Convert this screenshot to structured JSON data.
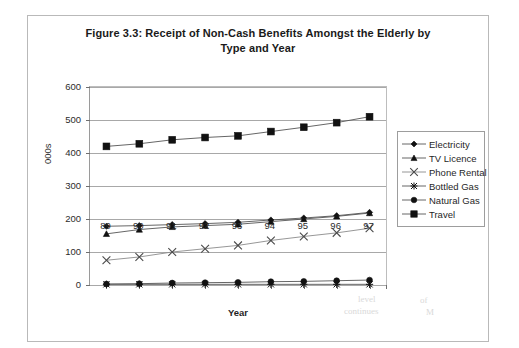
{
  "figure": {
    "title": "Figure 3.3: Receipt of Non-Cash Benefits Amongst the Elderly by Type and Year",
    "title_line1": "Figure 3.3: Receipt of Non-Cash Benefits Amongst the Elderly by",
    "title_line2": "Type and Year"
  },
  "artifacts": {
    "a1": "level",
    "a2": "continues",
    "a3": "of",
    "a4": "M"
  },
  "chart_data": {
    "type": "line",
    "title": "Figure 3.3: Receipt of Non-Cash Benefits Amongst the Elderly by Type and Year",
    "xlabel": "Year",
    "ylabel": "000s",
    "categories": [
      "89",
      "90",
      "91",
      "92",
      "93",
      "94",
      "95",
      "96",
      "97"
    ],
    "ylim": [
      0,
      600
    ],
    "yticks": [
      0,
      100,
      200,
      300,
      400,
      500,
      600
    ],
    "grid": true,
    "legend_position": "right",
    "series": [
      {
        "name": "Electricity",
        "marker": "diamond",
        "values": [
          178,
          180,
          183,
          186,
          190,
          197,
          203,
          210,
          220
        ]
      },
      {
        "name": "TV Licence",
        "marker": "triangle",
        "values": [
          155,
          168,
          176,
          180,
          184,
          192,
          200,
          208,
          218
        ]
      },
      {
        "name": "Phone Rental",
        "marker": "cross",
        "values": [
          75,
          85,
          100,
          110,
          120,
          135,
          147,
          158,
          172
        ]
      },
      {
        "name": "Bottled Gas",
        "marker": "star",
        "values": [
          2,
          2,
          2,
          2,
          2,
          2,
          2,
          2,
          2
        ]
      },
      {
        "name": "Natural Gas",
        "marker": "circle",
        "values": [
          3,
          4,
          6,
          7,
          8,
          10,
          11,
          13,
          15
        ]
      },
      {
        "name": "Travel",
        "marker": "square",
        "values": [
          420,
          428,
          440,
          447,
          452,
          465,
          478,
          492,
          510
        ]
      }
    ]
  },
  "legend": {
    "items": [
      {
        "label": "Electricity",
        "marker": "diamond"
      },
      {
        "label": "TV Licence",
        "marker": "triangle"
      },
      {
        "label": "Phone Rental",
        "marker": "cross"
      },
      {
        "label": "Bottled Gas",
        "marker": "star"
      },
      {
        "label": "Natural Gas",
        "marker": "circle"
      },
      {
        "label": "Travel",
        "marker": "square"
      }
    ]
  }
}
